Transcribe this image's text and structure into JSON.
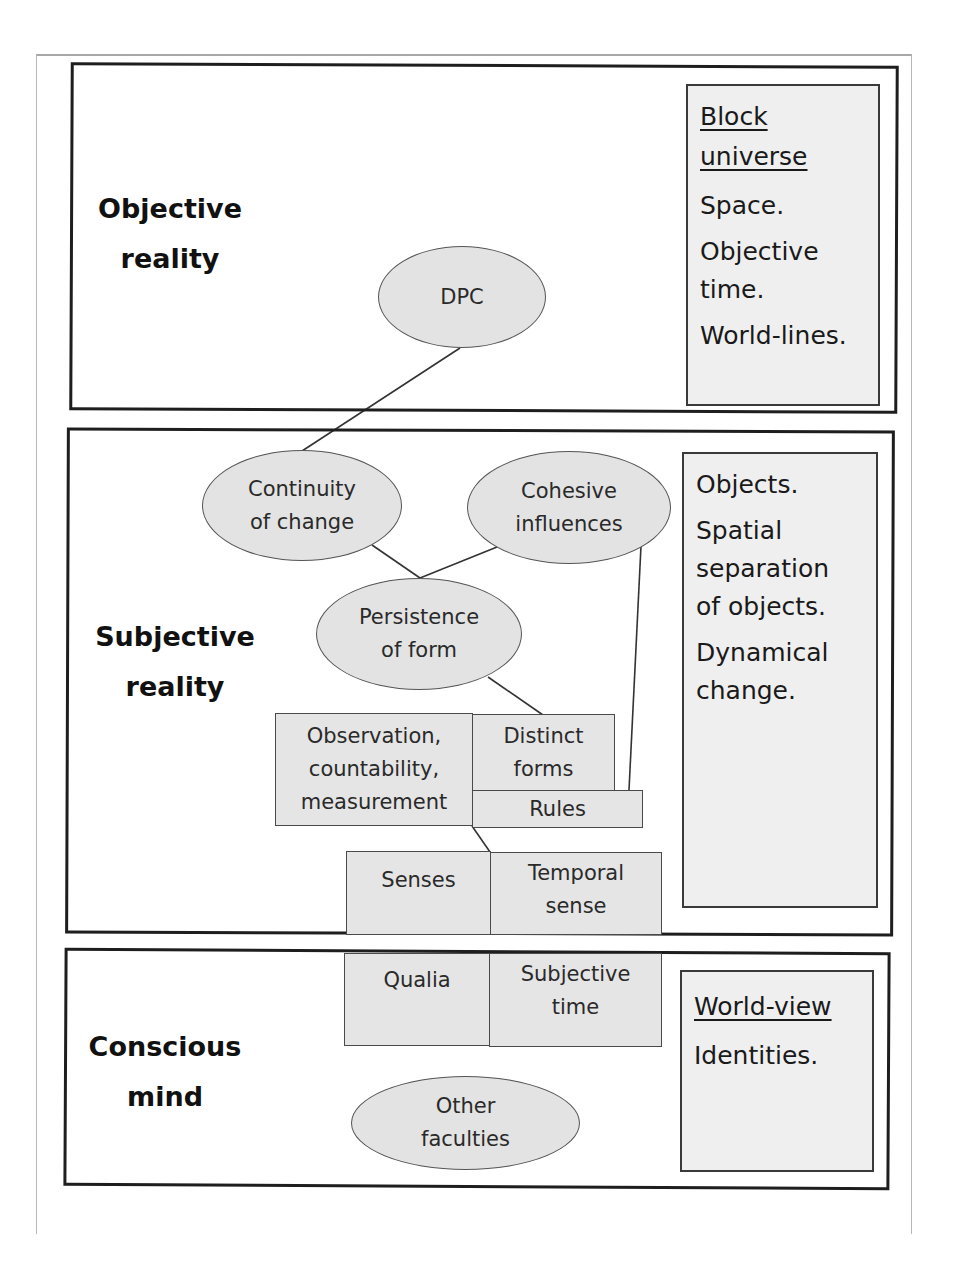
{
  "diagram": {
    "colors": {
      "panel_border": "#1e1e1e",
      "shape_fill": "#e3e3e3",
      "side_box_fill": "#efefef",
      "page_border": "#a8a8a8"
    },
    "panels": [
      {
        "id": "objective-reality",
        "label_lines": [
          "Objective",
          "reality"
        ],
        "side_box": {
          "heading_lines": [
            "Block",
            "universe"
          ],
          "items": [
            "Space.",
            "Objective time.",
            "World-lines."
          ]
        }
      },
      {
        "id": "subjective-reality",
        "label_lines": [
          "Subjective",
          "reality"
        ],
        "side_box": {
          "items": [
            "Objects.",
            "Spatial separation of objects.",
            "Dynamical change."
          ]
        }
      },
      {
        "id": "conscious-mind",
        "label_lines": [
          "Conscious",
          "mind"
        ],
        "side_box": {
          "heading_lines": [
            "World-view"
          ],
          "items": [
            "Identities."
          ]
        }
      }
    ],
    "nodes": {
      "dpc": {
        "shape": "ellipse",
        "lines": [
          "DPC"
        ]
      },
      "continuity": {
        "shape": "ellipse",
        "lines": [
          "Continuity",
          "of change"
        ]
      },
      "cohesive": {
        "shape": "ellipse",
        "lines": [
          "Cohesive",
          "influences"
        ]
      },
      "persistence": {
        "shape": "ellipse",
        "lines": [
          "Persistence",
          "of form"
        ]
      },
      "observation": {
        "shape": "rect",
        "lines": [
          "Observation,",
          "countability,",
          "measurement"
        ]
      },
      "distinct_forms": {
        "shape": "rect",
        "lines": [
          "Distinct",
          "forms"
        ]
      },
      "rules": {
        "shape": "rect",
        "lines": [
          "Rules"
        ]
      },
      "senses": {
        "shape": "rect",
        "lines": [
          "Senses"
        ]
      },
      "temporal_sense": {
        "shape": "rect",
        "lines": [
          "Temporal",
          "sense"
        ]
      },
      "qualia": {
        "shape": "rect",
        "lines": [
          "Qualia"
        ]
      },
      "subjective_time": {
        "shape": "rect",
        "lines": [
          "Subjective",
          "time"
        ]
      },
      "other_faculties": {
        "shape": "ellipse",
        "lines": [
          "Other",
          "faculties"
        ]
      }
    },
    "edges": [
      {
        "from": "dpc",
        "to": "continuity"
      },
      {
        "from": "continuity",
        "to": "persistence"
      },
      {
        "from": "cohesive",
        "to": "persistence"
      },
      {
        "from": "persistence",
        "to": "distinct_forms"
      },
      {
        "from": "cohesive",
        "to": "rules"
      },
      {
        "from": "observation",
        "to": "temporal_sense"
      }
    ]
  }
}
